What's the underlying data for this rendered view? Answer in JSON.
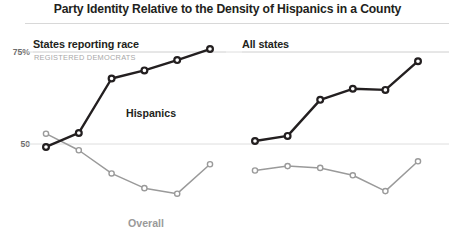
{
  "chart_data": {
    "type": "line",
    "title": "Party Identity Relative to the Density of Hispanics in a County",
    "xlabel": "",
    "ylabel": "",
    "ylim": [
      38,
      79
    ],
    "ytick_labels": [
      "75%",
      "50"
    ],
    "ytick_values": [
      75,
      50
    ],
    "grid": true,
    "legend_position": "inline-annotation",
    "panels": [
      {
        "key": "left",
        "title": "States reporting race",
        "subtitle": "REGISTERED DEMOCRATS",
        "x": [
          1,
          2,
          3,
          4,
          5,
          6
        ],
        "series": [
          {
            "name": "Hispanics",
            "color": "#231f20",
            "values": [
              49.2,
              53.0,
              67.8,
              70.0,
              72.8,
              75.8
            ],
            "label": "Hispanics",
            "label_x": 126,
            "label_y": 107
          },
          {
            "name": "Overall",
            "color": "#9a9a9a",
            "values": [
              52.8,
              48.3,
              42.0,
              38.0,
              36.5,
              44.5
            ],
            "label": "Overall",
            "label_x": 128,
            "label_y": 217
          }
        ]
      },
      {
        "key": "right",
        "title": "All states",
        "subtitle": "",
        "x": [
          1,
          2,
          3,
          4,
          5,
          6
        ],
        "series": [
          {
            "name": "Hispanics",
            "color": "#231f20",
            "values": [
              50.8,
              52.2,
              62.0,
              65.0,
              64.7,
              72.5
            ],
            "label": "",
            "label_x": 0,
            "label_y": 0
          },
          {
            "name": "Overall",
            "color": "#9a9a9a",
            "values": [
              42.8,
              44.0,
              43.5,
              41.5,
              37.2,
              45.3
            ],
            "label": "",
            "label_x": 0,
            "label_y": 0
          }
        ]
      }
    ]
  },
  "colors": {
    "dark_series": "#231f20",
    "light_series": "#9a9a9a",
    "gridline": "#dedede",
    "rule": "#d8d8d8",
    "subtitle": "#a8a8a8",
    "tick": "#6d6d6d"
  },
  "header": {
    "title": "Party Identity Relative to the Density of Hispanics in a County"
  },
  "axis": {
    "tick_top": "75%",
    "tick_mid": "50"
  },
  "panels": {
    "left": {
      "title": "States reporting race",
      "subtitle": "REGISTERED DEMOCRATS",
      "dark_label": "Hispanics",
      "light_label": "Overall"
    },
    "right": {
      "title": "All states",
      "subtitle": ""
    }
  }
}
